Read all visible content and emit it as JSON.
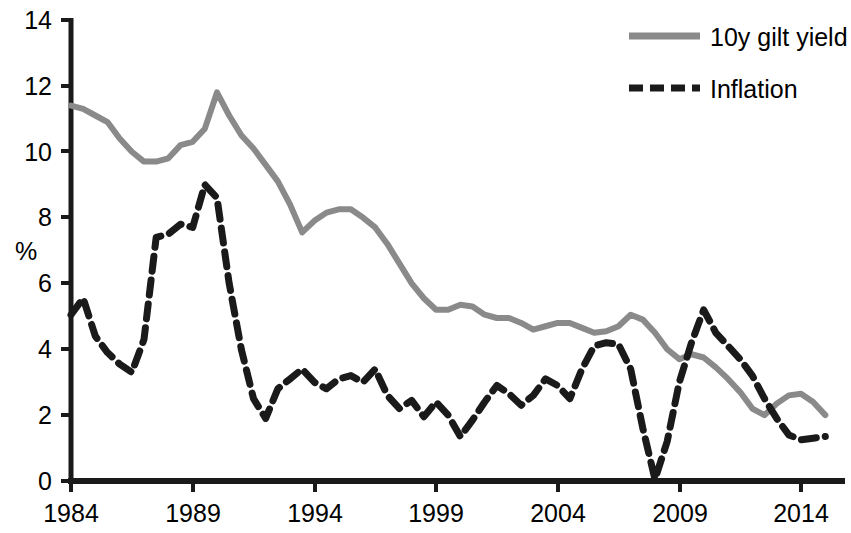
{
  "chart_data": {
    "type": "line",
    "title": "",
    "xlabel": "",
    "ylabel": "%",
    "xlim": [
      1983.5,
      2015.5
    ],
    "ylim": [
      0,
      14
    ],
    "ytick_values": [
      0,
      2,
      4,
      6,
      8,
      10,
      12,
      14
    ],
    "ytick_labels": [
      "0",
      "2",
      "4",
      "6",
      "8",
      "10",
      "12",
      "14"
    ],
    "xtick_values": [
      1984,
      1989,
      1994,
      1999,
      2004,
      2009,
      2014
    ],
    "xtick_labels": [
      "1984",
      "1989",
      "1994",
      "1999",
      "2004",
      "2009",
      "2014"
    ],
    "grid": false,
    "legend_position": "top-right",
    "series": [
      {
        "name": "10y gilt yield",
        "color": "#8a8a8a",
        "style": "solid",
        "x": [
          1984.0,
          1984.5,
          1985.0,
          1985.5,
          1986.0,
          1986.5,
          1987.0,
          1987.5,
          1988.0,
          1988.5,
          1989.0,
          1989.5,
          1990.0,
          1990.5,
          1991.0,
          1991.5,
          1992.0,
          1992.5,
          1993.0,
          1993.5,
          1994.0,
          1994.5,
          1995.0,
          1995.5,
          1996.0,
          1996.5,
          1997.0,
          1997.5,
          1998.0,
          1998.5,
          1999.0,
          1999.5,
          2000.0,
          2000.5,
          2001.0,
          2001.5,
          2002.0,
          2002.5,
          2003.0,
          2003.5,
          2004.0,
          2004.5,
          2005.0,
          2005.5,
          2006.0,
          2006.5,
          2007.0,
          2007.5,
          2008.0,
          2008.5,
          2009.0,
          2009.5,
          2010.0,
          2010.5,
          2011.0,
          2011.5,
          2012.0,
          2012.5,
          2013.0,
          2013.5,
          2014.0,
          2014.5,
          2015.0
        ],
        "y": [
          11.4,
          11.3,
          11.1,
          10.9,
          10.4,
          10.0,
          9.7,
          9.7,
          9.8,
          10.2,
          10.3,
          10.7,
          11.8,
          11.1,
          10.5,
          10.1,
          9.6,
          9.1,
          8.4,
          7.55,
          7.9,
          8.15,
          8.25,
          8.25,
          8.0,
          7.7,
          7.2,
          6.6,
          6.0,
          5.55,
          5.2,
          5.2,
          5.35,
          5.3,
          5.05,
          4.95,
          4.95,
          4.8,
          4.6,
          4.7,
          4.8,
          4.8,
          4.65,
          4.5,
          4.55,
          4.7,
          5.05,
          4.9,
          4.5,
          4.0,
          3.7,
          3.85,
          3.75,
          3.45,
          3.1,
          2.7,
          2.2,
          2.0,
          2.35,
          2.6,
          2.65,
          2.4,
          2.0
        ]
      },
      {
        "name": "Inflation",
        "color": "#1a1a1a",
        "style": "dashed",
        "x": [
          1984.0,
          1984.5,
          1985.0,
          1985.5,
          1986.0,
          1986.5,
          1987.0,
          1987.5,
          1988.0,
          1988.5,
          1989.0,
          1989.5,
          1990.0,
          1990.5,
          1991.0,
          1991.5,
          1992.0,
          1992.5,
          1993.0,
          1993.5,
          1994.0,
          1994.5,
          1995.0,
          1995.5,
          1996.0,
          1996.5,
          1997.0,
          1997.5,
          1998.0,
          1998.5,
          1999.0,
          1999.5,
          2000.0,
          2000.5,
          2001.0,
          2001.5,
          2002.0,
          2002.5,
          2003.0,
          2003.5,
          2004.0,
          2004.5,
          2005.0,
          2005.5,
          2006.0,
          2006.5,
          2007.0,
          2007.5,
          2008.0,
          2008.5,
          2009.0,
          2009.5,
          2010.0,
          2010.5,
          2011.0,
          2011.5,
          2012.0,
          2012.5,
          2013.0,
          2013.5,
          2014.0,
          2014.5,
          2015.0
        ],
        "y": [
          5.05,
          5.55,
          4.4,
          3.9,
          3.55,
          3.3,
          4.3,
          7.4,
          7.5,
          7.8,
          7.7,
          9.0,
          8.6,
          6.0,
          4.0,
          2.5,
          1.9,
          2.8,
          3.1,
          3.4,
          3.0,
          2.8,
          3.1,
          3.2,
          3.0,
          3.4,
          2.6,
          2.2,
          2.45,
          1.95,
          2.4,
          2.0,
          1.35,
          1.85,
          2.4,
          2.9,
          2.65,
          2.3,
          2.6,
          3.1,
          2.9,
          2.5,
          3.4,
          4.1,
          4.2,
          4.15,
          3.4,
          1.6,
          0.05,
          1.2,
          3.0,
          4.2,
          5.2,
          4.5,
          4.1,
          3.7,
          3.2,
          2.5,
          1.9,
          1.4,
          1.25,
          1.3,
          1.35
        ]
      }
    ]
  },
  "axes": {
    "ylabel": "%",
    "ytick_labels": [
      "14",
      "12",
      "10",
      "8",
      "6",
      "4",
      "2",
      "0"
    ],
    "xtick_labels": [
      "1984",
      "1989",
      "1994",
      "1999",
      "2004",
      "2009",
      "2014"
    ]
  },
  "legend": {
    "entries": [
      {
        "label": "10y gilt yield",
        "color": "#8a8a8a",
        "style": "solid"
      },
      {
        "label": "Inflation",
        "color": "#1a1a1a",
        "style": "dashed"
      }
    ]
  }
}
